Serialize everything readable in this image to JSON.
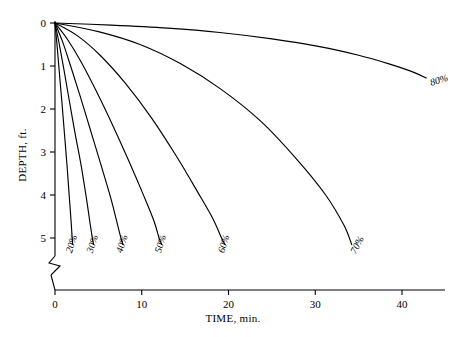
{
  "chart_data": {
    "type": "line",
    "title": "",
    "xlabel": "TIME, min.",
    "ylabel": "DEPTH, ft.",
    "xlim": [
      0,
      44
    ],
    "ylim": [
      0,
      5.5
    ],
    "y_inverted": true,
    "grid": false,
    "legend": "inline-curve-labels",
    "y_axis_break": true,
    "xticks": [
      0,
      10,
      20,
      30,
      40
    ],
    "xticklabels": [
      "0",
      "10",
      "20",
      "30",
      "40"
    ],
    "yticks": [
      0,
      1,
      2,
      3,
      4,
      5
    ],
    "yticklabels": [
      "0",
      "1",
      "2",
      "3",
      "4",
      "5"
    ],
    "series": [
      {
        "name": "20%",
        "label": "20%",
        "x": [
          0,
          0.25,
          0.5,
          0.8,
          1.1,
          1.4,
          1.65,
          1.85,
          1.98,
          2.05
        ],
        "y": [
          0,
          0.55,
          1.15,
          1.85,
          2.6,
          3.35,
          4.05,
          4.6,
          5.0,
          5.15
        ]
      },
      {
        "name": "30%",
        "label": "30%",
        "x": [
          0,
          0.5,
          1.0,
          1.6,
          2.3,
          3.0,
          3.6,
          4.0,
          4.3,
          4.45
        ],
        "y": [
          0,
          0.5,
          1.05,
          1.75,
          2.55,
          3.3,
          4.05,
          4.6,
          5.0,
          5.15
        ]
      },
      {
        "name": "40%",
        "label": "40%",
        "x": [
          0,
          0.9,
          1.8,
          2.9,
          4.1,
          5.3,
          6.4,
          7.1,
          7.6,
          7.85
        ],
        "y": [
          0,
          0.45,
          1.0,
          1.7,
          2.5,
          3.3,
          4.05,
          4.6,
          5.0,
          5.15
        ]
      },
      {
        "name": "50%",
        "label": "50%",
        "x": [
          0,
          1.5,
          3.0,
          4.8,
          6.7,
          8.6,
          10.3,
          11.4,
          12.0,
          12.3
        ],
        "y": [
          0,
          0.4,
          0.9,
          1.6,
          2.4,
          3.25,
          4.05,
          4.6,
          5.0,
          5.15
        ]
      },
      {
        "name": "60%",
        "label": "60%",
        "x": [
          0,
          2.6,
          5.2,
          8.1,
          11.1,
          14.0,
          16.5,
          18.2,
          19.2,
          19.6
        ],
        "y": [
          0,
          0.3,
          0.75,
          1.4,
          2.2,
          3.1,
          3.95,
          4.55,
          5.0,
          5.15
        ]
      },
      {
        "name": "70%",
        "label": "70%",
        "x": [
          0,
          5.0,
          9.8,
          14.5,
          19.2,
          23.8,
          28.0,
          31.2,
          33.3,
          34.2
        ],
        "y": [
          0,
          0.2,
          0.5,
          0.95,
          1.55,
          2.3,
          3.2,
          4.0,
          4.7,
          5.15
        ]
      },
      {
        "name": "80%",
        "label": "80%",
        "x": [
          0,
          6.5,
          13.0,
          19.0,
          25.0,
          30.5,
          35.0,
          38.5,
          41.0,
          42.8
        ],
        "y": [
          0,
          0.05,
          0.12,
          0.22,
          0.37,
          0.55,
          0.75,
          0.95,
          1.12,
          1.28
        ]
      }
    ]
  }
}
